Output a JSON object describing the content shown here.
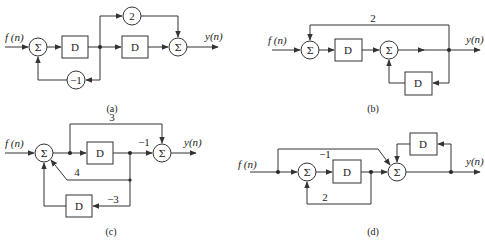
{
  "diagrams": {
    "a": {
      "caption": "(a)",
      "input_label": "f (n)",
      "output_label": "y(n)",
      "sum_symbol": "Σ",
      "delay_label": "D",
      "gain_top": "2",
      "gain_feedback": "−1"
    },
    "b": {
      "caption": "(b)",
      "input_label": "f (n)",
      "output_label": "y(n)",
      "sum_symbol": "Σ",
      "delay_label": "D",
      "gain_top": "2"
    },
    "c": {
      "caption": "(c)",
      "input_label": "f (n)",
      "output_label": "y(n)",
      "sum_symbol": "Σ",
      "delay_label": "D",
      "gain_top": "3",
      "gain_forward": "−1",
      "gain_mid": "4",
      "gain_bottom": "−3"
    },
    "d": {
      "caption": "(d)",
      "input_label": "f (n)",
      "output_label": "y(n)",
      "sum_symbol": "Σ",
      "delay_label": "D",
      "gain_top": "−1",
      "gain_feedback": "2"
    }
  }
}
